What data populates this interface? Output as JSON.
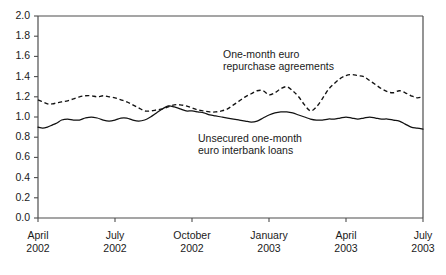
{
  "chart_data": {
    "type": "line",
    "title": "",
    "subtitle": "",
    "xlabel": "",
    "ylabel": "",
    "ylim": [
      0.0,
      2.0
    ],
    "ytick_labels": [
      "2.0",
      "1.8",
      "1.6",
      "1.4",
      "1.2",
      "1.0",
      "0.8",
      "0.6",
      "0.4",
      "0.2",
      "0.0"
    ],
    "ytick_values": [
      2.0,
      1.8,
      1.6,
      1.4,
      1.2,
      1.0,
      0.8,
      0.6,
      0.4,
      0.2,
      0.0
    ],
    "xtick_labels": [
      {
        "month": "April",
        "year": "2002"
      },
      {
        "month": "July",
        "year": "2002"
      },
      {
        "month": "October",
        "year": "2002"
      },
      {
        "month": "January",
        "year": "2003"
      },
      {
        "month": "April",
        "year": "2003"
      },
      {
        "month": "July",
        "year": "2003"
      }
    ],
    "x_range": [
      "April 2002",
      "July 2003"
    ],
    "grid": false,
    "legend_position": "inline-annotations",
    "annotations": [
      {
        "name": "repo-annotation",
        "lines": [
          "One-month euro",
          "repurchase agreements"
        ]
      },
      {
        "name": "unsecured-annotation",
        "lines": [
          "Unsecured one-month",
          "euro interbank loans"
        ]
      }
    ],
    "series": [
      {
        "name": "One-month euro repurchase agreements",
        "style": "dashed",
        "color": "#111111",
        "x": [
          0.0,
          0.8,
          1.6,
          2.4,
          3.2,
          4.0,
          5.0,
          6.0,
          7.0,
          8.0,
          9.0,
          10.0,
          11.0,
          12.0,
          13.0,
          14.0,
          15.0,
          16.0,
          17.0,
          18.0,
          19.0,
          20.0,
          21.0,
          22.0,
          23.0,
          24.0,
          25.0,
          26.0,
          27.0,
          28.0,
          29.0,
          30.0,
          31.0,
          32.0,
          33.0,
          34.0,
          35.0,
          36.0,
          37.0,
          38.0,
          39.0,
          40.0,
          41.0,
          42.0,
          43.0,
          44.0,
          45.0,
          46.0,
          47.0,
          48.0,
          49.0,
          50.0,
          51.0,
          52.0,
          53.0,
          54.0,
          55.0,
          56.0,
          57.0,
          58.0,
          59.0,
          60.0,
          61.0,
          62.0,
          63.0,
          64.0,
          65.0
        ],
        "values": [
          1.17,
          1.15,
          1.13,
          1.13,
          1.14,
          1.15,
          1.16,
          1.18,
          1.2,
          1.21,
          1.21,
          1.2,
          1.21,
          1.2,
          1.19,
          1.17,
          1.15,
          1.12,
          1.09,
          1.06,
          1.06,
          1.07,
          1.08,
          1.1,
          1.12,
          1.12,
          1.11,
          1.09,
          1.07,
          1.06,
          1.05,
          1.05,
          1.06,
          1.08,
          1.12,
          1.16,
          1.2,
          1.23,
          1.26,
          1.26,
          1.22,
          1.24,
          1.28,
          1.3,
          1.26,
          1.2,
          1.12,
          1.06,
          1.1,
          1.18,
          1.27,
          1.33,
          1.38,
          1.41,
          1.42,
          1.41,
          1.4,
          1.36,
          1.32,
          1.28,
          1.25,
          1.24,
          1.26,
          1.24,
          1.21,
          1.19,
          1.2
        ],
        "min": 1.05,
        "max": 1.42
      },
      {
        "name": "Unsecured one-month euro interbank loans",
        "style": "solid",
        "color": "#111111",
        "x": [
          0.0,
          0.8,
          1.6,
          2.4,
          3.2,
          4.0,
          5.0,
          6.0,
          7.0,
          8.0,
          9.0,
          10.0,
          11.0,
          12.0,
          13.0,
          14.0,
          15.0,
          16.0,
          17.0,
          18.0,
          19.0,
          20.0,
          21.0,
          22.0,
          23.0,
          24.0,
          25.0,
          26.0,
          27.0,
          28.0,
          29.0,
          30.0,
          31.0,
          32.0,
          33.0,
          34.0,
          35.0,
          36.0,
          37.0,
          38.0,
          39.0,
          40.0,
          41.0,
          42.0,
          43.0,
          44.0,
          45.0,
          46.0,
          47.0,
          48.0,
          49.0,
          50.0,
          51.0,
          52.0,
          53.0,
          54.0,
          55.0,
          56.0,
          57.0,
          58.0,
          59.0,
          60.0,
          61.0,
          62.0,
          63.0,
          64.0,
          65.0
        ],
        "values": [
          0.9,
          0.89,
          0.9,
          0.92,
          0.94,
          0.97,
          0.98,
          0.97,
          0.97,
          0.99,
          1.0,
          0.99,
          0.97,
          0.96,
          0.97,
          0.99,
          0.99,
          0.97,
          0.96,
          0.97,
          1.0,
          1.04,
          1.08,
          1.11,
          1.1,
          1.08,
          1.06,
          1.06,
          1.05,
          1.04,
          1.02,
          1.01,
          1.0,
          0.99,
          0.98,
          0.97,
          0.96,
          0.95,
          0.96,
          0.99,
          1.02,
          1.04,
          1.05,
          1.05,
          1.04,
          1.02,
          1.0,
          0.98,
          0.97,
          0.97,
          0.98,
          0.98,
          0.99,
          1.0,
          0.99,
          0.98,
          0.99,
          1.0,
          0.99,
          0.98,
          0.98,
          0.97,
          0.96,
          0.93,
          0.9,
          0.89,
          0.88
        ],
        "min": 0.88,
        "max": 1.11
      }
    ]
  }
}
